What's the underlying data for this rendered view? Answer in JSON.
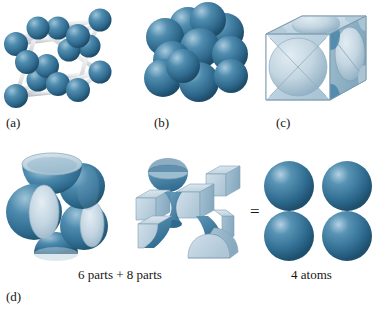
{
  "figure": {
    "background_color": "#ffffff",
    "panels": [
      {
        "id": "a",
        "label": "(a)",
        "art_name": "ball-and-stick-fcc-unit-cell",
        "description": "ball-and-stick model of face-centered cubic unit cell"
      },
      {
        "id": "b",
        "label": "(b)",
        "art_name": "space-filling-fcc-cluster",
        "description": "space filling hard sphere cluster of fcc unit cell"
      },
      {
        "id": "c",
        "label": "(c)",
        "art_name": "cube-clipped-sphere-sections",
        "description": "unit cell cube with sphere sections clipped by cube faces"
      }
    ],
    "exploded": {
      "label": "(d)",
      "left_art_name": "six-half-spheres-group",
      "middle_art_name": "eight-corner-octant-group",
      "right_art_name": "four-whole-atoms-group",
      "equals": "=",
      "parts_caption": "6 parts + 8 parts",
      "atoms_caption": "4 atoms"
    },
    "colors": {
      "sphere_dark": "#2c6489",
      "sphere_mid": "#3b7da4",
      "sphere_light": "#b9d3e2",
      "cut_face": "#c3d4de",
      "cut_face_edge": "#7f9cae",
      "rod": "#e8eaec",
      "rod_shade": "#b9bec3",
      "text": "#161616"
    }
  }
}
